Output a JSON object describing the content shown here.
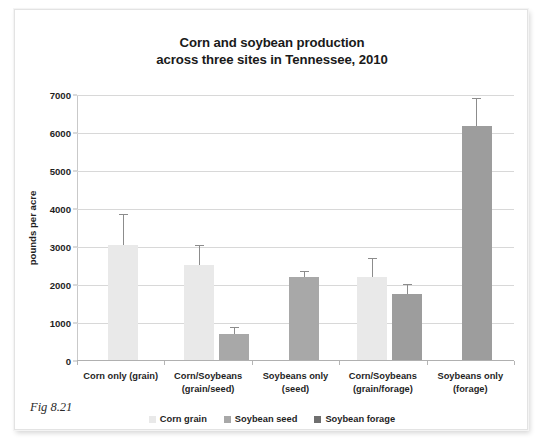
{
  "figure": {
    "caption": "Fig 8.21"
  },
  "chart_data": {
    "type": "bar",
    "title": "Corn and soybean production across three sites in Tennessee, 2010",
    "title_lines": [
      "Corn and soybean production",
      "across three sites in Tennessee, 2010"
    ],
    "xlabel": "",
    "ylabel": "pounds per acre",
    "ylim": [
      0,
      7000
    ],
    "yticks": [
      0,
      1000,
      2000,
      3000,
      4000,
      5000,
      6000,
      7000
    ],
    "ytick_labels": [
      "0",
      "1000",
      "2000",
      "3000",
      "4000",
      "5000",
      "6000",
      "7000"
    ],
    "grid": true,
    "legend_position": "bottom",
    "categories": [
      "Corn only (grain)",
      "Corn/Soybeans (grain/seed)",
      "Soybeans only (seed)",
      "Corn/Soybeans (grain/forage)",
      "Soybeans only (forage)"
    ],
    "category_lines": [
      [
        "Corn only (grain)"
      ],
      [
        "Corn/Soybeans",
        "(grain/seed)"
      ],
      [
        "Soybeans only",
        "(seed)"
      ],
      [
        "Corn/Soybeans",
        "(grain/forage)"
      ],
      [
        "Soybeans only",
        "(forage)"
      ]
    ],
    "series": [
      {
        "name": "Corn grain",
        "color": "#e9e9e9",
        "values": [
          3050,
          2530,
          null,
          2200,
          null
        ],
        "errors_high": [
          3830,
          3020,
          null,
          2680,
          null
        ]
      },
      {
        "name": "Soybean seed",
        "color": "#a8a8a8",
        "values": [
          null,
          700,
          2200,
          null,
          null
        ],
        "errors_high": [
          null,
          860,
          2350,
          null,
          null
        ]
      },
      {
        "name": "Soybean forage",
        "color": "#9d9d9d",
        "values": [
          null,
          null,
          null,
          1770,
          6180
        ],
        "errors_high": [
          null,
          null,
          null,
          2000,
          6900
        ]
      }
    ],
    "bars": [
      {
        "group": 0,
        "series": "Corn grain",
        "color": "#e9e9e9",
        "value": 3050,
        "error_high": 3830,
        "x_center_pct": 10.6,
        "width_px": 30
      },
      {
        "group": 1,
        "series": "Corn grain",
        "color": "#e9e9e9",
        "value": 2530,
        "error_high": 3020,
        "x_center_pct": 28.0,
        "width_px": 30
      },
      {
        "group": 1,
        "series": "Soybean seed",
        "color": "#a8a8a8",
        "value": 700,
        "error_high": 860,
        "x_center_pct": 36.0,
        "width_px": 30
      },
      {
        "group": 2,
        "series": "Soybean seed",
        "color": "#a8a8a8",
        "value": 2200,
        "error_high": 2350,
        "x_center_pct": 52.0,
        "width_px": 30
      },
      {
        "group": 3,
        "series": "Corn grain",
        "color": "#e9e9e9",
        "value": 2200,
        "error_high": 2680,
        "x_center_pct": 67.6,
        "width_px": 30
      },
      {
        "group": 3,
        "series": "Soybean forage",
        "color": "#9d9d9d",
        "value": 1770,
        "error_high": 2000,
        "x_center_pct": 75.6,
        "width_px": 30
      },
      {
        "group": 4,
        "series": "Soybean forage",
        "color": "#9d9d9d",
        "value": 6180,
        "error_high": 6900,
        "x_center_pct": 91.5,
        "width_px": 30
      }
    ],
    "legend": [
      {
        "label": "Corn grain",
        "color": "#e9e9e9"
      },
      {
        "label": "Soybean seed",
        "color": "#a8a8a8"
      },
      {
        "label": "Soybean forage",
        "color": "#6f6f6f"
      }
    ]
  }
}
